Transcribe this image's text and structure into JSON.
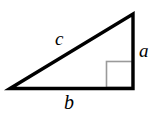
{
  "figure": {
    "type": "right-triangle-diagram",
    "background_color": "#ffffff",
    "stroke_color": "#000000",
    "right_angle_marker_color": "#999999",
    "vertices": {
      "left": [
        10,
        88
      ],
      "apex": [
        133,
        14
      ],
      "right": [
        133,
        88
      ]
    },
    "right_angle_marker": {
      "x": 106,
      "y": 61,
      "width": 27,
      "height": 27
    },
    "labels": {
      "hypotenuse": "c",
      "vertical_leg": "a",
      "base": "b"
    }
  }
}
